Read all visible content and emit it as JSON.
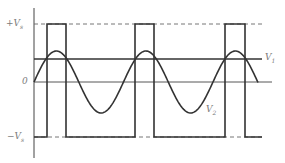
{
  "diagram": {
    "type": "waveform comparison",
    "axis_labels": {
      "plus_vs": "+V",
      "plus_vs_sub": "s",
      "zero": "0",
      "minus_vs": "−V",
      "minus_vs_sub": "s"
    },
    "curve_labels": {
      "v1": "V",
      "v1_sub": "1",
      "v2": "V",
      "v2_sub": "2"
    },
    "colors": {
      "waveform": "#333333",
      "axis": "#444444",
      "dashed": "#666666",
      "label": "#7a7a7a"
    },
    "levels": {
      "plus_vs_y": 24,
      "v1_y": 59,
      "zero_y": 82,
      "minus_vs_y": 137
    },
    "pulses": [
      {
        "x_start": 47,
        "x_end": 66
      },
      {
        "x_start": 135,
        "x_end": 154
      },
      {
        "x_start": 225,
        "x_end": 245
      }
    ]
  }
}
